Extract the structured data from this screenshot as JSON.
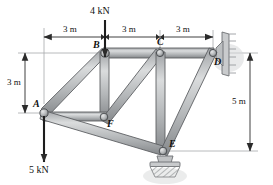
{
  "figure": {
    "type": "engineering-truss-diagram"
  },
  "loads": [
    {
      "id": "load-4kn",
      "label": "4 kN",
      "at_node": "B",
      "direction": "down",
      "magnitude": 4,
      "unit": "kN"
    },
    {
      "id": "load-5kn",
      "label": "5 kN",
      "at_node": "A",
      "direction": "down",
      "magnitude": 5,
      "unit": "kN"
    }
  ],
  "dimensions": {
    "top": [
      {
        "id": "dim-top-1",
        "label": "3 m",
        "value": 3,
        "unit": "m",
        "from": "A-line",
        "to": "B"
      },
      {
        "id": "dim-top-2",
        "label": "3 m",
        "value": 3,
        "unit": "m",
        "from": "B",
        "to": "C"
      },
      {
        "id": "dim-top-3",
        "label": "3 m",
        "value": 3,
        "unit": "m",
        "from": "C",
        "to": "D"
      }
    ],
    "left": [
      {
        "id": "dim-left-1",
        "label": "3 m",
        "value": 3,
        "unit": "m",
        "from": "B-level",
        "to": "A-level"
      }
    ],
    "right": [
      {
        "id": "dim-right-1",
        "label": "5 m",
        "value": 5,
        "unit": "m",
        "from": "D-level",
        "to": "E-level"
      }
    ]
  },
  "nodes": [
    {
      "id": "A",
      "label": "A",
      "x": 44,
      "y": 113,
      "label_dx": -11,
      "label_dy": -14
    },
    {
      "id": "B",
      "label": "B",
      "x": 105,
      "y": 53,
      "label_dx": -12,
      "label_dy": -13
    },
    {
      "id": "C",
      "label": "C",
      "x": 160,
      "y": 53,
      "label_dx": -3,
      "label_dy": -16
    },
    {
      "id": "D",
      "label": "D",
      "x": 213,
      "y": 53,
      "label_dx": 1,
      "label_dy": 4
    },
    {
      "id": "E",
      "label": "E",
      "x": 163,
      "y": 151,
      "label_dx": 6,
      "label_dy": -12
    },
    {
      "id": "F",
      "label": "F",
      "x": 104,
      "y": 117,
      "label_dx": 3,
      "label_dy": 2
    }
  ],
  "members": [
    {
      "id": "member-AB",
      "from": "A",
      "to": "B"
    },
    {
      "id": "member-BC",
      "from": "B",
      "to": "C"
    },
    {
      "id": "member-CD",
      "from": "C",
      "to": "D"
    },
    {
      "id": "member-BF",
      "from": "B",
      "to": "F"
    },
    {
      "id": "member-AF",
      "from": "A",
      "to": "F"
    },
    {
      "id": "member-FC",
      "from": "F",
      "to": "C"
    },
    {
      "id": "member-CE",
      "from": "C",
      "to": "E"
    },
    {
      "id": "member-AE",
      "from": "A",
      "to": "E"
    },
    {
      "id": "member-ED",
      "from": "E",
      "to": "D"
    }
  ],
  "supports": [
    {
      "id": "support-D",
      "at_node": "D",
      "type": "wall-pin-plate",
      "orientation": "vertical-wall-right"
    },
    {
      "id": "support-E",
      "at_node": "E",
      "type": "pin-ground-hatched",
      "orientation": "ground-below"
    }
  ],
  "colors": {
    "member_fill": "#b9bbbd",
    "member_edge": "#5d6063",
    "member_highlight": "#d9dbdc",
    "line": "#9a9c9f",
    "text": "#111111",
    "support_fill": "#c4c6c8",
    "background": "#ffffff"
  }
}
